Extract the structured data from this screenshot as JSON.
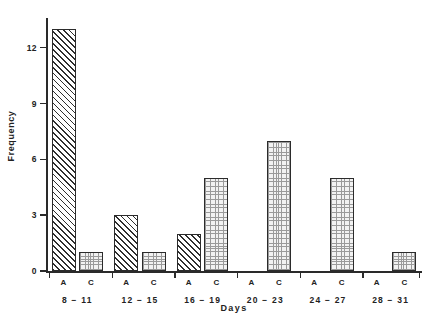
{
  "chart_data": {
    "type": "bar",
    "title": "",
    "subtitle": "",
    "xlabel": "Days",
    "ylabel": "Frequency",
    "categories": [
      "8 − 11",
      "12 − 15",
      "16 − 19",
      "20 − 23",
      "24 − 27",
      "28 − 31"
    ],
    "subcategories": [
      "A",
      "C"
    ],
    "series": [
      {
        "name": "A",
        "values": [
          13,
          3,
          2,
          0,
          0,
          0
        ],
        "fill": "diagonal-hatch"
      },
      {
        "name": "C",
        "values": [
          1,
          1,
          5,
          7,
          5,
          1
        ],
        "fill": "dotted-grid"
      }
    ],
    "ylim": [
      0,
      13.6
    ],
    "yticks": [
      0,
      3,
      6,
      9,
      12
    ],
    "ytick_labels": [
      "0",
      "3",
      "6",
      "9",
      "12"
    ],
    "grid": false,
    "legend": "none",
    "axis_color": "#2a2a2a",
    "bar_edge_color": "#2b2b2b",
    "series_a_color": "#2e2e2e",
    "series_c_color": "#9a9a9a",
    "background": "#ffffff"
  },
  "axes": {
    "y_title": "Frequency",
    "x_title": "Days"
  }
}
